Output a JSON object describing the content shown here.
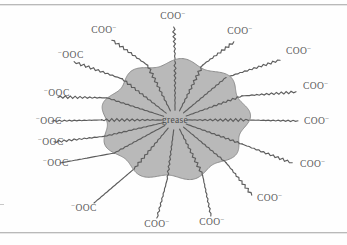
{
  "figure": {
    "name": "soap-micelle-grease-diagram",
    "core_label": "grease",
    "anion_label_left": "⁻OOC",
    "anion_label_right": "COO⁻",
    "chain_count": 16,
    "colors": {
      "blob_fill": "#b9b9b9",
      "blob_stroke": "#8e8e8e",
      "chain_stroke": "#5d5d5d",
      "text": "#5a5a5a",
      "rule": "#b9b9b9",
      "background": "#fefefe"
    }
  },
  "chart_data": {
    "type": "diagram",
    "title": "grease",
    "xlabel": "",
    "ylabel": "",
    "center": [
      175,
      120
    ],
    "radius_x": 72,
    "radius_y": 58,
    "chains": [
      {
        "id": 1,
        "angle_deg": 180,
        "label": "⁻OOC",
        "label_x": 36,
        "label_y": 124,
        "anchor": "start",
        "tip_x": 52,
        "tip_y": 121
      },
      {
        "id": 2,
        "angle_deg": 202,
        "label": "⁻OOC",
        "label_x": 44,
        "label_y": 96,
        "anchor": "start",
        "tip_x": 58,
        "tip_y": 97
      },
      {
        "id": 3,
        "angle_deg": 224,
        "label": "⁻OOC",
        "label_x": 58,
        "label_y": 58,
        "anchor": "start",
        "tip_x": 74,
        "tip_y": 62
      },
      {
        "id": 4,
        "angle_deg": 248,
        "label": "COO⁻",
        "label_x": 104,
        "label_y": 33,
        "anchor": "middle",
        "tip_x": 112,
        "tip_y": 40
      },
      {
        "id": 5,
        "angle_deg": 270,
        "label": "COO⁻",
        "label_x": 173,
        "label_y": 19,
        "anchor": "middle",
        "tip_x": 174,
        "tip_y": 27
      },
      {
        "id": 6,
        "angle_deg": 292,
        "label": "COO⁻",
        "label_x": 240,
        "label_y": 34,
        "anchor": "middle",
        "tip_x": 234,
        "tip_y": 42
      },
      {
        "id": 7,
        "angle_deg": 314,
        "label": "COO⁻",
        "label_x": 286,
        "label_y": 54,
        "anchor": "start",
        "tip_x": 280,
        "tip_y": 60
      },
      {
        "id": 8,
        "angle_deg": 336,
        "label": "COO⁻",
        "label_x": 303,
        "label_y": 89,
        "anchor": "start",
        "tip_x": 296,
        "tip_y": 92
      },
      {
        "id": 9,
        "angle_deg": 0,
        "label": "COO⁻",
        "label_x": 304,
        "label_y": 124,
        "anchor": "start",
        "tip_x": 298,
        "tip_y": 121
      },
      {
        "id": 10,
        "angle_deg": 24,
        "label": "COO⁻",
        "label_x": 300,
        "label_y": 167,
        "anchor": "start",
        "tip_x": 292,
        "tip_y": 163
      },
      {
        "id": 11,
        "angle_deg": 46,
        "label": "COO⁻",
        "label_x": 257,
        "label_y": 201,
        "anchor": "start",
        "tip_x": 252,
        "tip_y": 195
      },
      {
        "id": 12,
        "angle_deg": 68,
        "label": "COO⁻",
        "label_x": 212,
        "label_y": 225,
        "anchor": "middle",
        "tip_x": 211,
        "tip_y": 216
      },
      {
        "id": 13,
        "angle_deg": 96,
        "label": "COO⁻",
        "label_x": 157,
        "label_y": 227,
        "anchor": "middle",
        "tip_x": 157,
        "tip_y": 218
      },
      {
        "id": 14,
        "angle_deg": 124,
        "label": "⁻OOC",
        "label_x": 84,
        "label_y": 211,
        "anchor": "middle",
        "tip_x": 94,
        "tip_y": 203
      },
      {
        "id": 15,
        "angle_deg": 146,
        "label": "⁻OOC",
        "label_x": 43,
        "label_y": 166,
        "anchor": "start",
        "tip_x": 60,
        "tip_y": 163
      },
      {
        "id": 16,
        "angle_deg": 164,
        "label": "⁻OOC",
        "label_x": 38,
        "label_y": 145,
        "anchor": "start",
        "tip_x": 54,
        "tip_y": 142
      }
    ]
  }
}
